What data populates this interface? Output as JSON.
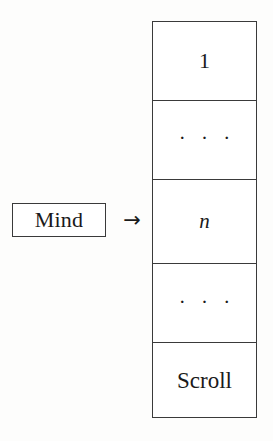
{
  "diagram": {
    "background_color": "#fdfdfc",
    "line_color": "#3a3a3a",
    "text_color": "#1a1a1a",
    "source_node": {
      "label": "Mind"
    },
    "connector": {
      "icon": "right-arrow-icon",
      "glyph": "→"
    },
    "target": {
      "name": "Scroll stack",
      "cells": [
        {
          "label": "1",
          "style": "numeral"
        },
        {
          "label": "· · ·",
          "style": "ellipsis"
        },
        {
          "label": "n",
          "style": "math-italic"
        },
        {
          "label": "· · ·",
          "style": "ellipsis"
        },
        {
          "label": "Scroll",
          "style": "word"
        }
      ]
    }
  }
}
